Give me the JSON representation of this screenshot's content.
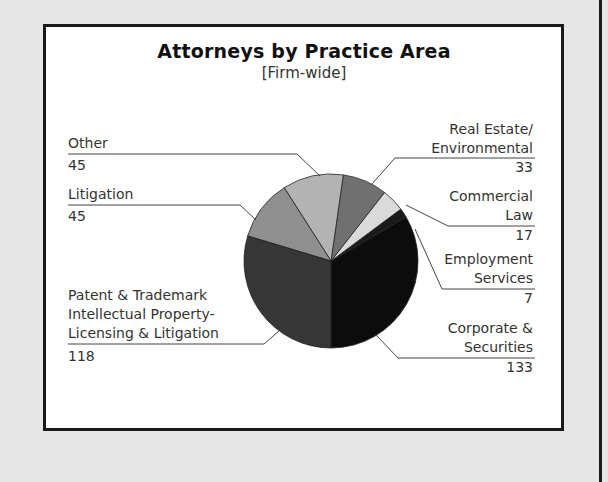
{
  "chart_data": {
    "type": "pie",
    "title": "Attorneys by Practice Area",
    "subtitle": "[Firm-wide]",
    "categories": [
      "Corporate & Securities",
      "Employment Services",
      "Commercial Law",
      "Real Estate/ Environmental",
      "Other",
      "Litigation",
      "Patent & Trademark Intellectual Property-Licensing & Litigation"
    ],
    "values": [
      133,
      7,
      17,
      33,
      45,
      45,
      118
    ],
    "colors": [
      "#0c0c0c",
      "#1a1a1a",
      "#dadada",
      "#707070",
      "#b3b3b3",
      "#8f8f8f",
      "#363636"
    ],
    "legend": "none; direct labels with leader lines"
  },
  "labels": {
    "other": {
      "name": "Other",
      "value": "45"
    },
    "litigation": {
      "name": "Litigation",
      "value": "45"
    },
    "patent": {
      "line1": "Patent & Trademark",
      "line2": "Intellectual Property-",
      "line3": "Licensing & Litigation",
      "value": "118"
    },
    "real_estate": {
      "line1": "Real Estate/",
      "line2": "Environmental",
      "value": "33"
    },
    "commercial": {
      "line1": "Commercial",
      "line2": "Law",
      "value": "17"
    },
    "employment": {
      "line1": "Employment",
      "line2": "Services",
      "value": "7"
    },
    "corporate": {
      "line1": "Corporate &",
      "line2": "Securities",
      "value": "133"
    }
  }
}
